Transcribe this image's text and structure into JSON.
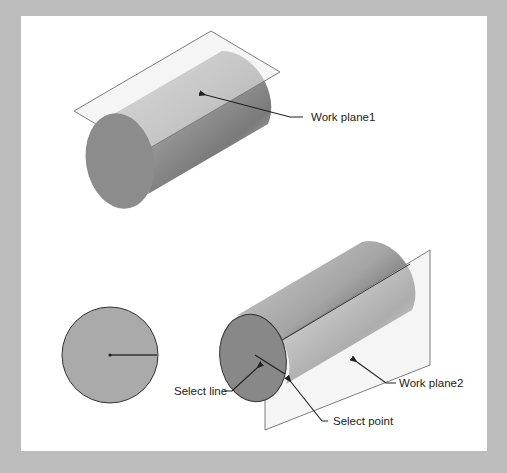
{
  "figure": {
    "background_color": "#bdbdbd",
    "panel_color": "#ffffff",
    "top_view": {
      "callouts": [
        {
          "id": "work-plane-1",
          "label": "Work plane1"
        }
      ]
    },
    "bottom_view": {
      "callouts": [
        {
          "id": "select-line",
          "label": "Select line"
        },
        {
          "id": "select-point",
          "label": "Select point"
        },
        {
          "id": "work-plane-2",
          "label": "Work plane2"
        }
      ]
    },
    "colors": {
      "cylinder_face": "#8a8a8a",
      "cylinder_body_light": "#c8c8c8",
      "cylinder_body_dark": "#7a7a7a",
      "plane_fill": "#e6e6e6",
      "plane_stroke": "#7d7d7d",
      "leader": "#222222",
      "circle_fill": "#a9a9a9"
    }
  }
}
